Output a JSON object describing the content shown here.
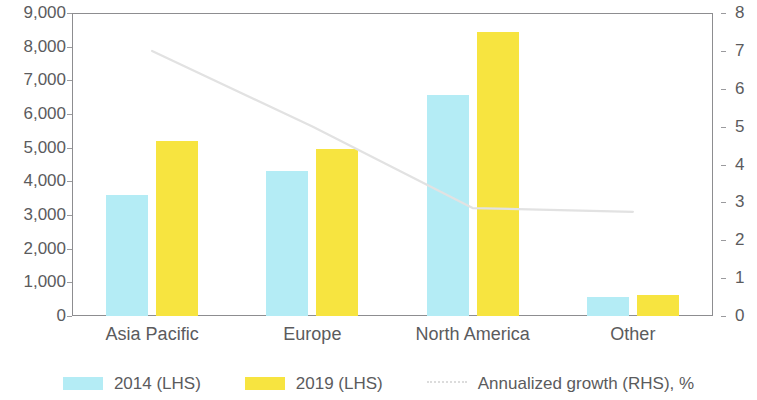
{
  "chart_data": {
    "type": "bar",
    "title": "",
    "subtitle": "",
    "xlabel": "",
    "ylabel": "",
    "categories": [
      "Asia Pacific",
      "Europe",
      "North America",
      "Other"
    ],
    "series": [
      {
        "name": "2014 (LHS)",
        "axis": "left",
        "type": "bar",
        "color": "#b4ecf5",
        "values": [
          3600,
          4300,
          6550,
          550
        ]
      },
      {
        "name": "2019 (LHS)",
        "axis": "left",
        "type": "bar",
        "color": "#f7e440",
        "values": [
          5200,
          4950,
          8450,
          620
        ]
      },
      {
        "name": "Annualized growth (RHS), %",
        "axis": "right",
        "type": "line",
        "color": "#e2e2e2",
        "values": [
          7.0,
          5.0,
          2.85,
          2.75
        ]
      }
    ],
    "left_axis": {
      "label": "",
      "min": 0,
      "max": 9000,
      "step": 1000,
      "ticks": [
        "0",
        "1,000",
        "2,000",
        "3,000",
        "4,000",
        "5,000",
        "6,000",
        "7,000",
        "8,000",
        "9,000"
      ]
    },
    "right_axis": {
      "label": "",
      "min": 0,
      "max": 8,
      "step": 1,
      "ticks": [
        "0",
        "1",
        "2",
        "3",
        "4",
        "5",
        "6",
        "7",
        "8"
      ]
    },
    "grid": false,
    "legend_position": "bottom"
  },
  "legend": {
    "items": [
      {
        "label": "2014 (LHS)",
        "swatch": "bar-2014-swatch"
      },
      {
        "label": "2019 (LHS)",
        "swatch": "bar-2019-swatch"
      },
      {
        "label": "Annualized growth (RHS), %",
        "swatch": "growth-line-swatch"
      }
    ]
  },
  "colors": {
    "bar_2014": "#b4ecf5",
    "bar_2019": "#f7e440",
    "growth_line": "#e2e2e2",
    "axis": "#8d8d90",
    "text": "#5b5b5d",
    "background": "#ffffff"
  }
}
